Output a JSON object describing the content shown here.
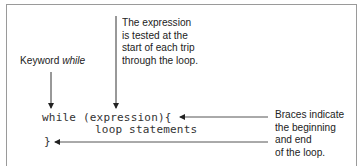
{
  "labels": {
    "keyword_prefix": "Keyword ",
    "keyword_word": "while",
    "expression_note": [
      "The expression",
      "is tested at the",
      "start of each trip",
      "through the loop."
    ],
    "braces_note": [
      "Braces indicate",
      "the beginning",
      "and end",
      "of the loop."
    ]
  },
  "code": {
    "line1": "while (expression){",
    "line2": "loop statements",
    "line3": "}"
  }
}
